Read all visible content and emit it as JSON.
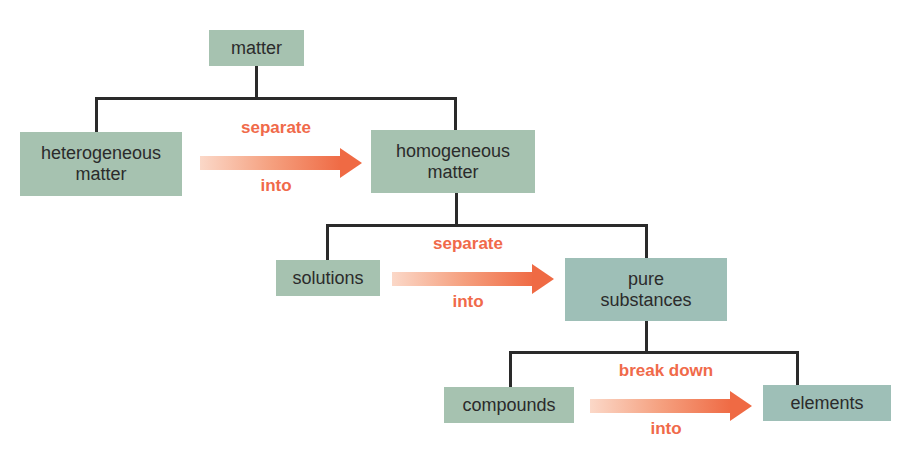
{
  "diagram": {
    "nodes": {
      "matter": "matter",
      "heterogeneous_line1": "heterogeneous",
      "heterogeneous_line2": "matter",
      "homogeneous_line1": "homogeneous",
      "homogeneous_line2": "matter",
      "solutions": "solutions",
      "pure_line1": "pure",
      "pure_line2": "substances",
      "compounds": "compounds",
      "elements": "elements"
    },
    "arrows": [
      {
        "top": "separate",
        "bottom": "into",
        "from": "heterogeneous matter",
        "to": "homogeneous matter"
      },
      {
        "top": "separate",
        "bottom": "into",
        "from": "solutions",
        "to": "pure substances"
      },
      {
        "top": "break down",
        "bottom": "into",
        "from": "compounds",
        "to": "elements"
      }
    ],
    "colors": {
      "node_fill": "#a6c2b0",
      "node_fill_alt": "#9ebfb7",
      "arrow": "#ef6a44",
      "label": "#f06a4a",
      "connector": "#2a2a2a"
    }
  }
}
